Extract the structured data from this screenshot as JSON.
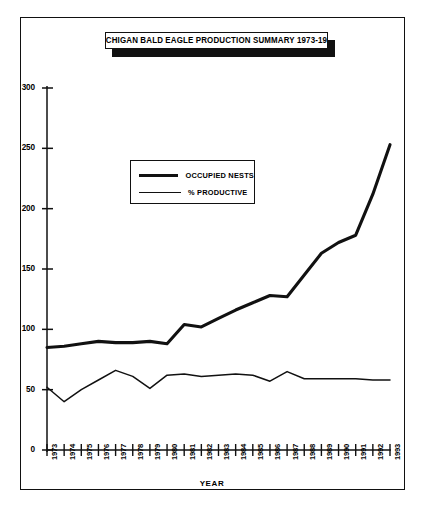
{
  "figure": {
    "title": "MICHIGAN BALD EAGLE PRODUCTION SUMMARY 1973-1993",
    "axis_title_x": "YEAR",
    "ink_color": "#111111",
    "background_color": "#ffffff"
  },
  "legend": {
    "position": "inside-upper-left",
    "entries": [
      {
        "label": "OCCUPIED NESTS",
        "style": "thick"
      },
      {
        "label": "% PRODUCTIVE",
        "style": "thin"
      }
    ]
  },
  "axes": {
    "y_ticks": [
      "300",
      "250",
      "200",
      "150",
      "100",
      "50",
      "0"
    ],
    "x_ticks": [
      "1973",
      "1974",
      "1975",
      "1976",
      "1977",
      "1978",
      "1979",
      "1980",
      "1981",
      "1982",
      "1983",
      "1984",
      "1985",
      "1986",
      "1987",
      "1988",
      "1989",
      "1990",
      "1991",
      "1992",
      "1993"
    ]
  },
  "chart_data": {
    "type": "line",
    "title": "MICHIGAN BALD EAGLE PRODUCTION SUMMARY 1973-1993",
    "xlabel": "YEAR",
    "ylabel": "",
    "grid": false,
    "legend_position": "upper left inside plot",
    "categories": [
      1973,
      1974,
      1975,
      1976,
      1977,
      1978,
      1979,
      1980,
      1981,
      1982,
      1983,
      1984,
      1985,
      1986,
      1987,
      1988,
      1989,
      1990,
      1991,
      1992,
      1993
    ],
    "ylim": [
      0,
      300
    ],
    "yticks": [
      0,
      50,
      100,
      150,
      200,
      250,
      300
    ],
    "series": [
      {
        "name": "OCCUPIED NESTS",
        "style": "thick",
        "values": [
          85,
          86,
          88,
          90,
          89,
          89,
          90,
          88,
          104,
          102,
          109,
          116,
          122,
          128,
          127,
          145,
          163,
          172,
          178,
          212,
          253
        ]
      },
      {
        "name": "% PRODUCTIVE",
        "style": "thin",
        "values": [
          52,
          40,
          50,
          58,
          66,
          61,
          51,
          62,
          63,
          61,
          62,
          63,
          62,
          57,
          65,
          59,
          59,
          59,
          59,
          58,
          58
        ]
      }
    ]
  }
}
